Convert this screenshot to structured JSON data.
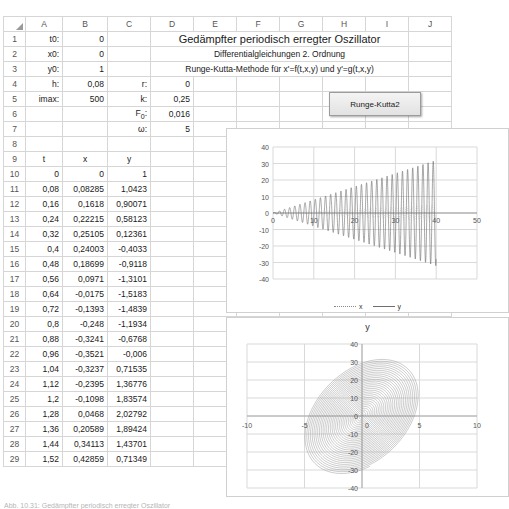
{
  "spreadsheet": {
    "columns": [
      "A",
      "B",
      "C",
      "D",
      "E",
      "F",
      "G",
      "H",
      "I",
      "J"
    ],
    "row_numbers": [
      "1",
      "2",
      "3",
      "4",
      "5",
      "6",
      "7",
      "8",
      "9",
      "10",
      "11",
      "12",
      "13",
      "14",
      "15",
      "16",
      "17",
      "18",
      "19",
      "20",
      "21",
      "22",
      "23",
      "24",
      "25",
      "26",
      "27",
      "28",
      "29"
    ]
  },
  "parameters": {
    "t0_label": "t0:",
    "t0_value": "0",
    "x0_label": "x0:",
    "x0_value": "0",
    "y0_label": "y0:",
    "y0_value": "1",
    "h_label": "h:",
    "h_value": "0,08",
    "imax_label": "imax:",
    "imax_value": "500",
    "r_label": "r:",
    "r_value": "0",
    "k_label": "k:",
    "k_value": "0,25",
    "F0_label": "F",
    "F0_sub": "0",
    "F0_label_colon": ":",
    "F0_value": "0,016",
    "omega_label": "ω:",
    "omega_value": "5"
  },
  "titles": {
    "main": "Gedämpfter periodisch erregter Oszillator",
    "sub1": "Differentialgleichungen 2. Ordnung",
    "sub2": "Runge-Kutta-Methode für x'=f(t,x,y) und y'=g(t,x,y)"
  },
  "button": {
    "label": "Runge-Kutta2"
  },
  "table": {
    "headers": [
      "t",
      "x",
      "y"
    ],
    "rows": [
      [
        "0",
        "0",
        "1"
      ],
      [
        "0,08",
        "0,08285",
        "1,0423"
      ],
      [
        "0,16",
        "0,1618",
        "0,90071"
      ],
      [
        "0,24",
        "0,22215",
        "0,58123"
      ],
      [
        "0,32",
        "0,25105",
        "0,12361"
      ],
      [
        "0,4",
        "0,24003",
        "-0,4033"
      ],
      [
        "0,48",
        "0,18699",
        "-0,9118"
      ],
      [
        "0,56",
        "0,0971",
        "-1,3101"
      ],
      [
        "0,64",
        "-0,0175",
        "-1,5183"
      ],
      [
        "0,72",
        "-0,1393",
        "-1,4839"
      ],
      [
        "0,8",
        "-0,248",
        "-1,1934"
      ],
      [
        "0,88",
        "-0,3241",
        "-0,6768"
      ],
      [
        "0,96",
        "-0,3521",
        "-0,006"
      ],
      [
        "1,04",
        "-0,3237",
        "0,71535"
      ],
      [
        "1,12",
        "-0,2395",
        "1,36776"
      ],
      [
        "1,2",
        "-0,1098",
        "1,83574"
      ],
      [
        "1,28",
        "0,0468",
        "2,02792"
      ],
      [
        "1,36",
        "0,20589",
        "1,89424"
      ],
      [
        "1,44",
        "0,34113",
        "1,43701"
      ],
      [
        "1,52",
        "0,42859",
        "0,71349"
      ]
    ]
  },
  "chart_data": [
    {
      "type": "line",
      "name": "time-series",
      "title": "",
      "xlabel": "",
      "ylabel": "",
      "xlim": [
        0,
        50
      ],
      "ylim": [
        -40,
        40
      ],
      "xticks": [
        "0",
        "10",
        "20",
        "30",
        "40",
        "50"
      ],
      "yticks": [
        "40",
        "30",
        "20",
        "10",
        "0",
        "-10",
        "-20",
        "-30",
        "-40"
      ],
      "grid": true,
      "legend_position": "bottom",
      "series": [
        {
          "name": "x",
          "style": "dotted",
          "color": "#8a8a8a",
          "description": "displacement, growing oscillation amplitude 0 to about 5"
        },
        {
          "name": "y",
          "style": "solid",
          "color": "#6f6f6f",
          "description": "velocity, growing oscillation amplitude 0 to about 32 up to t=40 then truncated"
        }
      ]
    },
    {
      "type": "scatter",
      "name": "phase-plot",
      "title": "y",
      "xlabel": "",
      "ylabel": "",
      "xlim": [
        -10,
        10
      ],
      "ylim": [
        -40,
        40
      ],
      "xticks": [
        "-10",
        "-5",
        "0",
        "5",
        "10"
      ],
      "yticks": [
        "40",
        "30",
        "20",
        "10",
        "0",
        "-10",
        "-20",
        "-30",
        "-40"
      ],
      "grid": true,
      "legend_position": "none",
      "series": [
        {
          "name": "y",
          "style": "solid",
          "color": "#8e8e8e",
          "description": "phase-space spiral filling ellipse x in -5..5, y in -32..32"
        }
      ]
    }
  ],
  "caption": {
    "text": "Abb. 10.31: Gedämpfter periodisch erregter Oszillator"
  }
}
